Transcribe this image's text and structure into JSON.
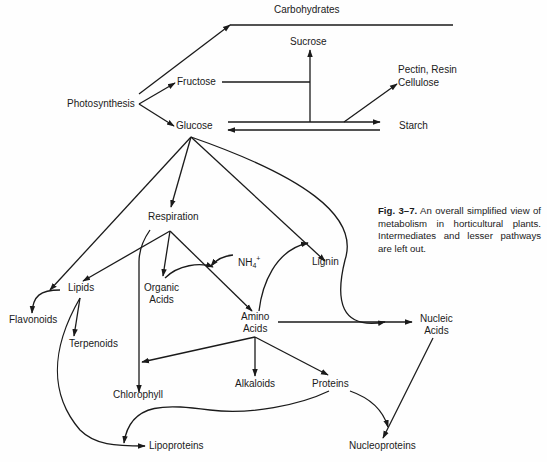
{
  "diagram": {
    "type": "metabolic-pathway-flowchart",
    "line_color": "#1a1a1a",
    "background": "#fefefe",
    "nodes": {
      "carbohydrates": "Carbohydrates",
      "sucrose": "Sucrose",
      "pectin_resin": "Pectin, Resin",
      "cellulose": "Cellulose",
      "photosynthesis": "Photosynthesis",
      "fructose": "Fructose",
      "glucose": "Glucose",
      "starch": "Starch",
      "respiration": "Respiration",
      "nh4_base": "NH",
      "nh4_sub": "4",
      "nh4_sup": "+",
      "lignin": "Lignin",
      "lipids": "Lipids",
      "organic_acids_1": "Organic",
      "organic_acids_2": "Acids",
      "flavonoids": "Flavonoids",
      "terpenoids": "Terpenoids",
      "amino_acids_1": "Amino",
      "amino_acids_2": "Acids",
      "nucleic_acids_1": "Nucleic",
      "nucleic_acids_2": "Acids",
      "chlorophyll": "Chlorophyll",
      "alkaloids": "Alkaloids",
      "proteins": "Proteins",
      "lipoproteins": "Lipoproteins",
      "nucleoproteins": "Nucleoproteins"
    },
    "edges": [
      {
        "from": "Photosynthesis",
        "to": "Carbohydrates"
      },
      {
        "from": "Photosynthesis",
        "to": "Fructose"
      },
      {
        "from": "Photosynthesis",
        "to": "Glucose"
      },
      {
        "from": "Fructose",
        "to": "Sucrose"
      },
      {
        "from": "Glucose",
        "to": "Sucrose"
      },
      {
        "from": "Glucose",
        "to": "Starch"
      },
      {
        "from": "Starch",
        "to": "Glucose"
      },
      {
        "from": "Glucose",
        "to": "Pectin, Resin, Cellulose"
      },
      {
        "from": "Glucose",
        "to": "Respiration"
      },
      {
        "from": "Glucose",
        "to": "Flavonoids"
      },
      {
        "from": "Glucose",
        "to": "Lignin"
      },
      {
        "from": "Glucose",
        "to": "Nucleic Acids"
      },
      {
        "from": "Respiration",
        "to": "Lipids"
      },
      {
        "from": "Respiration",
        "to": "Organic Acids"
      },
      {
        "from": "Respiration",
        "to": "Amino Acids"
      },
      {
        "from": "Respiration",
        "to": "Chlorophyll"
      },
      {
        "from": "NH4+",
        "to": "Amino Acids"
      },
      {
        "from": "Organic Acids",
        "to": "Amino Acids"
      },
      {
        "from": "Amino Acids",
        "to": "Lignin"
      },
      {
        "from": "Amino Acids",
        "to": "Nucleic Acids"
      },
      {
        "from": "Amino Acids",
        "to": "Chlorophyll"
      },
      {
        "from": "Amino Acids",
        "to": "Alkaloids"
      },
      {
        "from": "Amino Acids",
        "to": "Proteins"
      },
      {
        "from": "Lipids",
        "to": "Terpenoids"
      },
      {
        "from": "Lipids",
        "to": "Lipoproteins"
      },
      {
        "from": "Proteins",
        "to": "Lipoproteins"
      },
      {
        "from": "Proteins",
        "to": "Nucleoproteins"
      },
      {
        "from": "Nucleic Acids",
        "to": "Nucleoproteins"
      }
    ]
  },
  "caption": {
    "figure_label": "Fig. 3–7.",
    "text": "An overall simplified view of metabolism in horticultural plants. Intermediates and lesser pathways are left out."
  }
}
